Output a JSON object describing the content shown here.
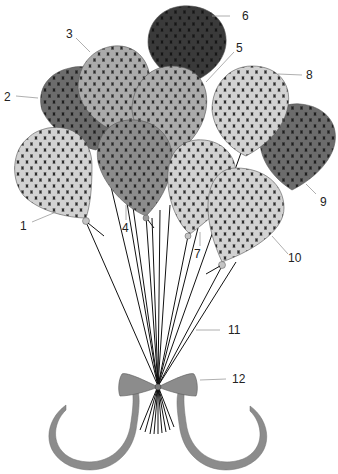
{
  "figure": {
    "callouts": [
      {
        "id": "1",
        "label": "1",
        "part": "balloon"
      },
      {
        "id": "2",
        "label": "2",
        "part": "balloon"
      },
      {
        "id": "3",
        "label": "3",
        "part": "balloon"
      },
      {
        "id": "4",
        "label": "4",
        "part": "balloon"
      },
      {
        "id": "5",
        "label": "5",
        "part": "balloon"
      },
      {
        "id": "6",
        "label": "6",
        "part": "balloon"
      },
      {
        "id": "7",
        "label": "7",
        "part": "balloon"
      },
      {
        "id": "8",
        "label": "8",
        "part": "balloon"
      },
      {
        "id": "9",
        "label": "9",
        "part": "balloon"
      },
      {
        "id": "10",
        "label": "10",
        "part": "balloon"
      },
      {
        "id": "11",
        "label": "11",
        "part": "strings"
      },
      {
        "id": "12",
        "label": "12",
        "part": "bow"
      }
    ],
    "colors": {
      "background": "#ffffff",
      "balloon_light": "#cfcfcf",
      "balloon_mid": "#a8a8a8",
      "balloon_midDark": "#8a8a8a",
      "balloon_dark": "#6a6a6a",
      "balloon_darkest": "#2e2e2e",
      "ribbon": "#8c8c8c",
      "string": "#111111",
      "pattern_line": "#2a2a2a"
    }
  }
}
